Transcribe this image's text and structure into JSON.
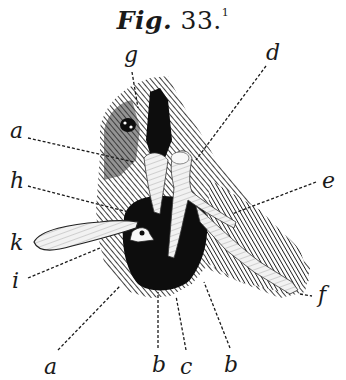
{
  "figure": {
    "title_word": "Fig.",
    "number": "33.",
    "footnote_mark": "1"
  },
  "labels": {
    "g": "g",
    "d": "d",
    "a_top": "a",
    "h": "h",
    "e": "e",
    "k": "k",
    "i": "i",
    "f": "f",
    "a_bottom": "a",
    "b_left": "b",
    "c": "c",
    "b_right": "b"
  },
  "colors": {
    "ink": "#1a1a1a",
    "paper": "#ffffff"
  }
}
